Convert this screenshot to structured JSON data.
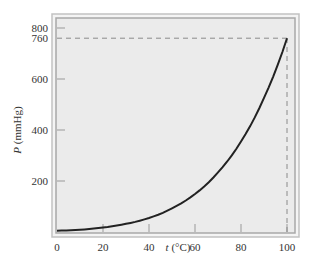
{
  "chart_data": {
    "type": "line",
    "title": "",
    "xlabel": "t (°C)",
    "xlabel_var": "t",
    "xlabel_unit": " (°C)",
    "ylabel": "P (mmHg)",
    "ylabel_var": "P",
    "ylabel_unit": " (mmHg)",
    "xlim": [
      0,
      100
    ],
    "ylim": [
      0,
      800
    ],
    "x_ticks": [
      0,
      20,
      40,
      60,
      80,
      100
    ],
    "y_ticks": [
      200,
      400,
      600,
      760,
      800
    ],
    "grid": false,
    "legend": null,
    "annotations": [
      {
        "type": "dashed-line",
        "from": [
          0,
          760
        ],
        "to": [
          100,
          760
        ]
      },
      {
        "type": "dashed-line",
        "from": [
          100,
          0
        ],
        "to": [
          100,
          760
        ]
      }
    ],
    "series": [
      {
        "name": "Vapor pressure of water",
        "x": [
          0,
          10,
          20,
          30,
          40,
          50,
          60,
          70,
          80,
          90,
          100
        ],
        "y": [
          5,
          9,
          18,
          32,
          55,
          93,
          149,
          234,
          355,
          526,
          760
        ]
      }
    ]
  },
  "colors": {
    "plot_background": "#ebebeb",
    "frame": "#b5b5b5",
    "curve": "#222222",
    "dashed": "#8a8a8a",
    "text": "#333333"
  }
}
